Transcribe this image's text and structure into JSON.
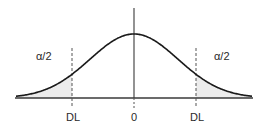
{
  "diagram": {
    "type": "normal-distribution-two-tailed",
    "colors": {
      "curve": "#1a1a1a",
      "axis": "#3a3a3a",
      "tail_fill": "#ececec",
      "dashed": "#555555",
      "text": "#2a2a2a"
    },
    "labels": {
      "left_tail": "α/2",
      "right_tail": "α/2",
      "left_limit": "DL",
      "center": "0",
      "right_limit": "DL"
    },
    "geometry": {
      "center_x": 134,
      "baseline_y": 98,
      "peak_y": 34,
      "sigma_px": 44,
      "x_start": 16,
      "x_end": 252,
      "left_limit_x": 72,
      "right_limit_x": 196,
      "axis_top_y": 8
    }
  }
}
